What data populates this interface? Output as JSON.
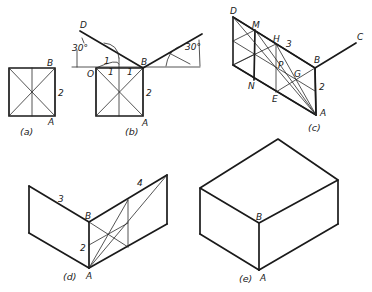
{
  "figure": {
    "panels": [
      {
        "id": "a",
        "caption": "(a)",
        "labels": {
          "B": "B",
          "A": "A",
          "dim": "2"
        }
      },
      {
        "id": "b",
        "caption": "(b)",
        "labels": {
          "D": "D",
          "O": "O",
          "B": "B",
          "A": "A",
          "dim": "2",
          "angle_left": "30°",
          "angle_right": "30°",
          "unit1": "1",
          "unit2": "1",
          "unit3": "1"
        }
      },
      {
        "id": "c",
        "caption": "(c)",
        "labels": {
          "D": "D",
          "M": "M",
          "H": "H",
          "dim3": "3",
          "B": "B",
          "C": "C",
          "P": "P",
          "G": "G",
          "N": "N",
          "E": "E",
          "dim2": "2",
          "A": "A"
        }
      },
      {
        "id": "d",
        "caption": "(d)",
        "labels": {
          "dim3": "3",
          "dim4": "4",
          "B": "B",
          "dim2": "2",
          "A": "A"
        }
      },
      {
        "id": "e",
        "caption": "(e)",
        "labels": {
          "B": "B",
          "A": "A"
        }
      }
    ]
  },
  "colors": {
    "ink": "#1a1a1a",
    "paper": "#ffffff"
  }
}
